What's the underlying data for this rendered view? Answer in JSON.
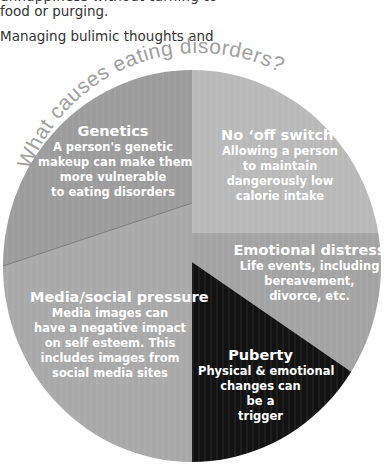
{
  "intro": {
    "cut_line": "unhappiness without turning to",
    "paragraph1_end": "food or purging.",
    "paragraph2_start": "Managing bulimic thoughts and"
  },
  "diagram": {
    "title": "What causes eating disorders?",
    "colors": {
      "genetics": "#9c9c9c",
      "no_off_switch": "#b9b9b9",
      "emotional_distress": "#a3a3a3",
      "puberty": "#121212",
      "media_social_pressure": "#a9a9a9",
      "title_text": "#a0a0a0"
    },
    "segments": [
      {
        "id": "genetics",
        "heading": "Genetics",
        "lines": [
          "A person's genetic",
          "makeup can make them",
          "more vulnerable",
          "to eating disorders"
        ]
      },
      {
        "id": "no_off_switch",
        "heading": "No ‘off switch’",
        "lines": [
          "Allowing a person",
          "to maintain",
          "dangerously low",
          "calorie intake"
        ]
      },
      {
        "id": "emotional_distress",
        "heading": "Emotional distress",
        "lines": [
          "Life events, including",
          "bereavement,",
          "divorce, etc."
        ]
      },
      {
        "id": "media_social_pressure",
        "heading": "Media/social pressure",
        "lines": [
          "Media images can",
          "have a negative impact",
          "on self esteem. This",
          "includes images from",
          "social media sites"
        ]
      },
      {
        "id": "puberty",
        "heading": "Puberty",
        "lines": [
          "Physical & emotional",
          "changes can",
          "be a",
          "trigger"
        ]
      }
    ]
  }
}
